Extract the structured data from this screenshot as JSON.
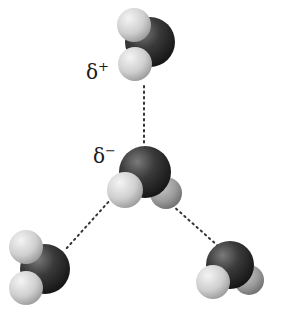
{
  "diagram": {
    "labels": {
      "delta_plus": {
        "symbol": "δ",
        "sign": "+"
      },
      "delta_minus": {
        "symbol": "δ",
        "sign": "−"
      }
    },
    "molecules": [
      {
        "id": "top",
        "atoms": [
          "oxygen",
          "hydrogen",
          "hydrogen"
        ],
        "partial_charge_label": "δ+"
      },
      {
        "id": "center",
        "atoms": [
          "oxygen",
          "hydrogen",
          "hydrogen"
        ],
        "partial_charge_label": "δ−"
      },
      {
        "id": "bottom-left",
        "atoms": [
          "oxygen",
          "hydrogen",
          "hydrogen"
        ]
      },
      {
        "id": "bottom-right",
        "atoms": [
          "oxygen",
          "hydrogen",
          "hydrogen"
        ]
      }
    ],
    "bonds": [
      {
        "type": "hydrogen-bond",
        "from": "top",
        "to": "center",
        "style": "dotted"
      },
      {
        "type": "hydrogen-bond",
        "from": "center",
        "to": "bottom-left",
        "style": "dotted"
      },
      {
        "type": "hydrogen-bond",
        "from": "center",
        "to": "bottom-right",
        "style": "dotted"
      }
    ],
    "colors": {
      "oxygen": "#2e2e2e",
      "hydrogen": "#d8d8d8",
      "bond": "#333333",
      "background": "#ffffff"
    }
  }
}
